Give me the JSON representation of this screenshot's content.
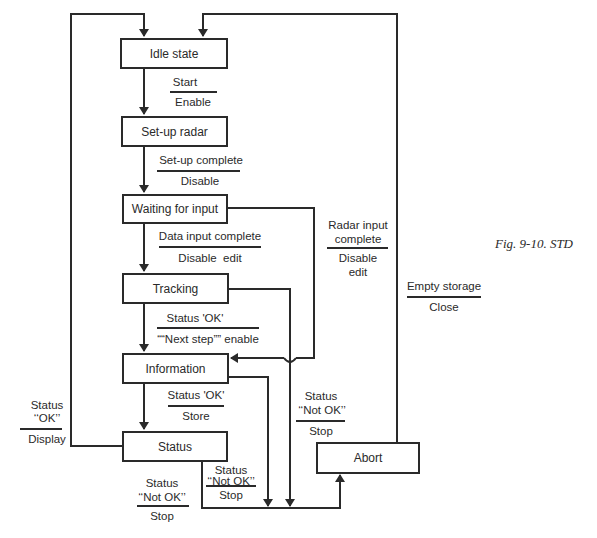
{
  "figure": {
    "caption": "Fig. 9-10. STD",
    "type": "state-transition-diagram"
  },
  "states": {
    "idle": "Idle state",
    "setup": "Set-up radar",
    "waiting": "Waiting for input",
    "tracking": "Tracking",
    "information": "Information",
    "status": "Status",
    "abort": "Abort"
  },
  "transitions": {
    "start": {
      "event": "Start",
      "action": "Enable"
    },
    "setup_complete": {
      "event": "Set-up complete",
      "action": "Disable"
    },
    "data_input_complete": {
      "event": "Data input complete",
      "action": "Disable  edit"
    },
    "radar_input_complete": {
      "event_line1": "Radar input",
      "event_line2": "complete",
      "action_line1": "Disable",
      "action_line2": "edit"
    },
    "tracking_ok": {
      "event": "Status 'OK'",
      "action": "““Next step”” enable"
    },
    "information_ok": {
      "event": "Status 'OK'",
      "action": "Store"
    },
    "status_ok": {
      "event_line1": "Status",
      "event_line2": "‘‘OK’’",
      "action": "Display"
    },
    "tracking_not_ok": {
      "event_line1": "Status",
      "event_line2": "‘‘Not OK’’",
      "action": "Stop"
    },
    "status_not_ok_inner": {
      "event_line1": "Status",
      "event_line2": "‘‘Not OK’’",
      "action": "Stop"
    },
    "status_not_ok_outer": {
      "event_line1": "Status",
      "event_line2": "‘‘Not OK’’",
      "action": "Stop"
    },
    "empty_storage": {
      "event": "Empty storage",
      "action": "Close"
    }
  }
}
